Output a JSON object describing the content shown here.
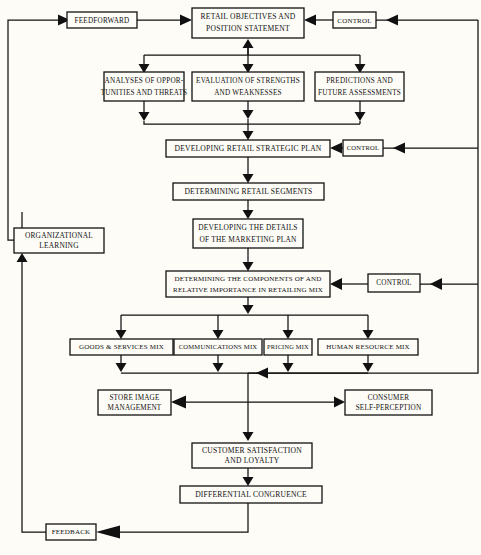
{
  "diagram": {
    "type": "flowchart",
    "background_color": "#fdfcf7",
    "line_color": "#111111",
    "nodes": [
      {
        "id": "feedforward",
        "label": "FEEDFORWARD",
        "lines": [
          "FEEDFORWARD"
        ],
        "x": 67,
        "y": 12,
        "w": 70,
        "h": 16,
        "font_size": 7.2
      },
      {
        "id": "retail-objectives",
        "label": "RETAIL OBJECTIVES AND POSITION STATEMENT",
        "lines": [
          "RETAIL OBJECTIVES AND",
          "POSITION STATEMENT"
        ],
        "x": 192,
        "y": 8,
        "w": 112,
        "h": 30,
        "font_size": 7.6
      },
      {
        "id": "control-1",
        "label": "CONTROL",
        "lines": [
          "CONTROL"
        ],
        "x": 333,
        "y": 12,
        "w": 43,
        "h": 16,
        "font_size": 7.0
      },
      {
        "id": "analyses-opportunities",
        "label": "ANALYSES OF OPPORTUNITIES AND THREATS",
        "lines": [
          "ANALYSES OF OPPOR-",
          "TUNITIES AND THREATS"
        ],
        "x": 104,
        "y": 72,
        "w": 80,
        "h": 29,
        "font_size": 7.2
      },
      {
        "id": "evaluation-strengths",
        "label": "EVALUATION OF STRENGTHS AND WEAKNESSES",
        "lines": [
          "EVALUATION OF STRENGTHS",
          "AND WEAKNESSES"
        ],
        "x": 192,
        "y": 72,
        "w": 112,
        "h": 29,
        "font_size": 7.2
      },
      {
        "id": "predictions-future",
        "label": "PREDICTIONS AND FUTURE ASSESSMENTS",
        "lines": [
          "PREDICTIONS AND",
          "FUTURE ASSESSMENTS"
        ],
        "x": 315,
        "y": 72,
        "w": 89,
        "h": 29,
        "font_size": 7.2
      },
      {
        "id": "developing-strategic-plan",
        "label": "DEVELOPING RETAIL STRATEGIC PLAN",
        "lines": [
          "DEVELOPING RETAIL STRATEGIC PLAN"
        ],
        "x": 166,
        "y": 140,
        "w": 164,
        "h": 17,
        "font_size": 7.6
      },
      {
        "id": "control-2",
        "label": "CONTROL",
        "lines": [
          "CONTROL"
        ],
        "x": 343,
        "y": 140,
        "w": 40,
        "h": 16,
        "font_size": 6.6
      },
      {
        "id": "determining-segments",
        "label": "DETERMINING RETAIL SEGMENTS",
        "lines": [
          "DETERMINING RETAIL SEGMENTS"
        ],
        "x": 173,
        "y": 183,
        "w": 151,
        "h": 17,
        "font_size": 7.6
      },
      {
        "id": "developing-marketing-plan",
        "label": "DEVELOPING THE DETAILS OF THE MARKETING PLAN",
        "lines": [
          "DEVELOPING THE DETAILS",
          "OF THE MARKETING PLAN"
        ],
        "x": 193,
        "y": 219,
        "w": 110,
        "h": 29,
        "font_size": 7.4
      },
      {
        "id": "organizational-learning",
        "label": "ORGANIZATIONAL LEARNING",
        "lines": [
          "ORGANIZATIONAL",
          "LEARNING"
        ],
        "x": 14,
        "y": 228,
        "w": 90,
        "h": 25,
        "font_size": 7.4
      },
      {
        "id": "determining-components",
        "label": "DETERMINING THE COMPONENTS OF AND RELATIVE IMPORTANCE IN RETAILING MIX",
        "lines": [
          "DETERMINING THE COMPONENTS OF AND",
          "RELATIVE IMPORTANCE IN RETAILING MIX"
        ],
        "x": 166,
        "y": 271,
        "w": 164,
        "h": 26,
        "font_size": 7.0
      },
      {
        "id": "control-3",
        "label": "CONTROL",
        "lines": [
          "CONTROL"
        ],
        "x": 368,
        "y": 274,
        "w": 52,
        "h": 18,
        "font_size": 7.2
      },
      {
        "id": "goods-services-mix",
        "label": "GOODS & SERVICES MIX",
        "lines": [
          "GOODS & SERVICES MIX"
        ],
        "x": 70,
        "y": 339,
        "w": 103,
        "h": 16,
        "font_size": 7.0
      },
      {
        "id": "communications-mix",
        "label": "COMMUNICATIONS MIX",
        "lines": [
          "COMMUNICATIONS MIX"
        ],
        "x": 174,
        "y": 339,
        "w": 88,
        "h": 16,
        "font_size": 6.6
      },
      {
        "id": "pricing-mix",
        "label": "PRICING MIX",
        "lines": [
          "PRICING MIX"
        ],
        "x": 264,
        "y": 339,
        "w": 48,
        "h": 16,
        "font_size": 6.4
      },
      {
        "id": "human-resource-mix",
        "label": "HUMAN RESOURCE MIX",
        "lines": [
          "HUMAN RESOURCE MIX"
        ],
        "x": 318,
        "y": 339,
        "w": 100,
        "h": 16,
        "font_size": 7.0
      },
      {
        "id": "store-image-management",
        "label": "STORE IMAGE MANAGEMENT",
        "lines": [
          "STORE IMAGE",
          "MANAGEMENT"
        ],
        "x": 98,
        "y": 390,
        "w": 73,
        "h": 25,
        "font_size": 7.2
      },
      {
        "id": "consumer-self-perception",
        "label": "CONSUMER SELF-PERCEPTION",
        "lines": [
          "CONSUMER",
          "SELF-PERCEPTION"
        ],
        "x": 345,
        "y": 390,
        "w": 87,
        "h": 25,
        "font_size": 7.2
      },
      {
        "id": "customer-satisfaction",
        "label": "CUSTOMER SATISFACTION AND LOYALTY",
        "lines": [
          "CUSTOMER SATISFACTION",
          "AND LOYALTY"
        ],
        "x": 192,
        "y": 443,
        "w": 120,
        "h": 25,
        "font_size": 7.6
      },
      {
        "id": "differential-congruence",
        "label": "DIFFERENTIAL CONGRUENCE",
        "lines": [
          "DIFFERENTIAL CONGRUENCE"
        ],
        "x": 180,
        "y": 486,
        "w": 142,
        "h": 17,
        "font_size": 7.6
      },
      {
        "id": "feedback",
        "label": "FEEDBACK",
        "lines": [
          "FEEDBACK"
        ],
        "x": 46,
        "y": 524,
        "w": 50,
        "h": 16,
        "font_size": 7.0
      }
    ],
    "edges": [
      {
        "from": "left-loop",
        "to": "feedforward",
        "kind": "feedforward-entry"
      },
      {
        "from": "feedforward",
        "to": "retail-objectives",
        "kind": "horizontal"
      },
      {
        "from": "control-1",
        "to": "retail-objectives",
        "kind": "horizontal"
      },
      {
        "from": "right-loop",
        "to": "control-1",
        "kind": "horizontal"
      },
      {
        "from": "retail-objectives",
        "to": "analyses-opportunities",
        "kind": "branch-down"
      },
      {
        "from": "retail-objectives",
        "to": "evaluation-strengths",
        "kind": "branch-down"
      },
      {
        "from": "retail-objectives",
        "to": "predictions-future",
        "kind": "branch-down"
      },
      {
        "from": "analyses-opportunities",
        "to": "developing-strategic-plan",
        "kind": "merge-down"
      },
      {
        "from": "evaluation-strengths",
        "to": "developing-strategic-plan",
        "kind": "merge-down"
      },
      {
        "from": "predictions-future",
        "to": "developing-strategic-plan",
        "kind": "merge-down"
      },
      {
        "from": "evaluation-strengths",
        "to": "retail-objectives",
        "kind": "up-arrow"
      },
      {
        "from": "control-2",
        "to": "developing-strategic-plan",
        "kind": "horizontal"
      },
      {
        "from": "developing-strategic-plan",
        "to": "determining-segments",
        "kind": "vertical"
      },
      {
        "from": "determining-segments",
        "to": "developing-marketing-plan",
        "kind": "vertical"
      },
      {
        "from": "developing-marketing-plan",
        "to": "determining-components",
        "kind": "vertical"
      },
      {
        "from": "control-3",
        "to": "determining-components",
        "kind": "horizontal"
      },
      {
        "from": "determining-components",
        "to": "goods-services-mix",
        "kind": "branch-down"
      },
      {
        "from": "determining-components",
        "to": "communications-mix",
        "kind": "branch-down"
      },
      {
        "from": "determining-components",
        "to": "pricing-mix",
        "kind": "branch-down"
      },
      {
        "from": "determining-components",
        "to": "human-resource-mix",
        "kind": "branch-down"
      },
      {
        "from": "mix-row",
        "to": "store-image-management",
        "kind": "merge-split"
      },
      {
        "from": "mix-row",
        "to": "consumer-self-perception",
        "kind": "merge-split"
      },
      {
        "from": "mix-row",
        "to": "customer-satisfaction",
        "kind": "vertical"
      },
      {
        "from": "customer-satisfaction",
        "to": "differential-congruence",
        "kind": "vertical"
      },
      {
        "from": "differential-congruence",
        "to": "feedback",
        "kind": "down-left"
      },
      {
        "from": "feedback",
        "to": "organizational-learning",
        "kind": "left-loop-up"
      },
      {
        "from": "organizational-learning",
        "to": "feedforward",
        "kind": "left-loop-up"
      }
    ]
  }
}
